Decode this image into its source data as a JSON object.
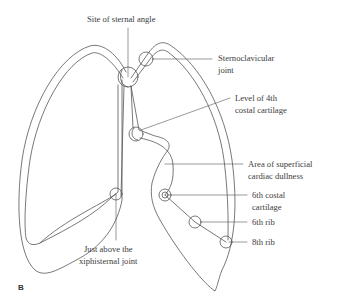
{
  "figure": {
    "panel_letter": "B",
    "stroke_color": "#555555",
    "labels": {
      "sternal_angle": {
        "text": "Site of sternal angle"
      },
      "sternoclavicular": {
        "line1": "Sternoclavicular",
        "line2": "joint"
      },
      "fourth_costal": {
        "line1": "Level of 4th",
        "line2": "costal cartilage"
      },
      "cardiac_dullness": {
        "line1": "Area of superficial",
        "line2": "cardiac dullness"
      },
      "sixth_costal": {
        "line1": "6th costal",
        "line2": "cartilage"
      },
      "sixth_rib": {
        "text": "6th rib"
      },
      "eighth_rib": {
        "text": "8th rib"
      },
      "xiphisternal": {
        "line1": "Just above the",
        "line2": "xiphisternal joint"
      }
    },
    "landmark_circles": [
      {
        "name": "sternal-angle",
        "cx": 128,
        "cy": 77,
        "r": 10
      },
      {
        "name": "sternoclavicular-joint",
        "cx": 146,
        "cy": 59,
        "r": 7
      },
      {
        "name": "fourth-costal-cartilage",
        "cx": 136,
        "cy": 134,
        "r": 7
      },
      {
        "name": "xiphisternal-joint",
        "cx": 116,
        "cy": 194,
        "r": 6
      },
      {
        "name": "sixth-costal-cartilage",
        "cx": 165,
        "cy": 195,
        "r": 6
      },
      {
        "name": "sixth-rib",
        "cx": 195,
        "cy": 222,
        "r": 6
      },
      {
        "name": "eighth-rib",
        "cx": 226,
        "cy": 242,
        "r": 6
      }
    ]
  }
}
